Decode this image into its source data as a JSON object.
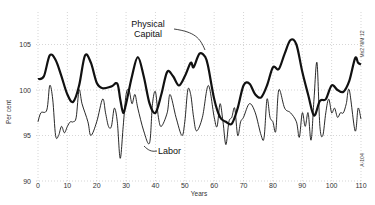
{
  "chart_data": {
    "type": "line",
    "title": "",
    "xlabel": "Years",
    "ylabel": "Per cent",
    "xlim": [
      0,
      110
    ],
    "ylim": [
      90,
      106
    ],
    "xticks": [
      0,
      10,
      20,
      30,
      40,
      50,
      60,
      70,
      80,
      90,
      100,
      110
    ],
    "xtick_labels": [
      "0",
      "10",
      "20",
      "30",
      "40",
      "50",
      "60",
      "70",
      "80",
      "90",
      "100",
      "110"
    ],
    "yticks": [
      90,
      95,
      100,
      105
    ],
    "ytick_labels": [
      "90",
      "95",
      "100",
      "105"
    ],
    "grid": true,
    "legend": "inline annotations",
    "annotations": [
      {
        "text": "Physical Capital",
        "points_to": [
          57,
          104
        ]
      },
      {
        "text": "Labor",
        "points_to": [
          36,
          94.2
        ]
      }
    ],
    "margin_notes": [
      "Ms2 N/M 12",
      "A-104"
    ],
    "series": [
      {
        "name": "Physical Capital",
        "style": "thick",
        "x": [
          0,
          2,
          4,
          6,
          8,
          10,
          12,
          14,
          16,
          18,
          20,
          22,
          25,
          27,
          28,
          29,
          30,
          32,
          34,
          36,
          38,
          40,
          42,
          44,
          46,
          48,
          50,
          52,
          53,
          55,
          57,
          58,
          60,
          62,
          64,
          66,
          68,
          70,
          72,
          74,
          76,
          78,
          80,
          82,
          84,
          86,
          88,
          90,
          92,
          94,
          96,
          98,
          100,
          102,
          104,
          106,
          108,
          109,
          110
        ],
        "y": [
          101.2,
          101.5,
          103.8,
          103.3,
          101.5,
          99.5,
          98.7,
          100.5,
          103.8,
          103.0,
          100.8,
          100.2,
          100.4,
          100.7,
          99.0,
          97.5,
          98.5,
          101.5,
          103.6,
          101.5,
          98.5,
          97.5,
          99.5,
          102.0,
          101.5,
          100.5,
          101.5,
          103.0,
          102.5,
          104.0,
          103.6,
          102.5,
          99.0,
          97.0,
          96.5,
          96.3,
          98.0,
          100.5,
          100.7,
          99.5,
          99.2,
          100.5,
          102.5,
          102.3,
          104.0,
          105.5,
          105.0,
          102.0,
          99.5,
          97.2,
          98.8,
          99.0,
          100.5,
          100.0,
          99.8,
          101.0,
          103.5,
          103.0,
          102.8
        ]
      },
      {
        "name": "Labor",
        "style": "thin",
        "x": [
          0,
          1,
          3,
          4,
          5,
          6,
          7,
          8,
          9,
          10,
          11,
          12,
          13,
          14,
          15,
          17,
          18,
          20,
          22,
          23,
          24,
          25,
          26,
          27,
          28,
          29,
          30,
          31,
          32,
          33,
          34,
          36,
          38,
          39,
          40,
          41,
          42,
          44,
          45,
          47,
          49,
          50,
          51,
          52,
          53,
          54,
          56,
          58,
          60,
          61,
          62,
          63,
          64,
          65,
          66,
          67,
          68,
          69,
          70,
          72,
          74,
          76,
          77,
          78,
          79,
          80,
          81,
          82,
          84,
          86,
          88,
          89,
          90,
          91,
          92,
          93,
          94,
          95,
          96,
          97,
          98,
          99,
          100,
          101,
          102,
          103,
          104,
          105,
          106,
          108,
          109,
          110
        ],
        "y": [
          96.5,
          97.5,
          97.8,
          100.5,
          99.0,
          95.0,
          95.0,
          96.0,
          95.3,
          96.0,
          96.5,
          96.5,
          97.0,
          100.0,
          98.5,
          96.5,
          95.0,
          96.5,
          99.0,
          97.5,
          96.0,
          96.0,
          98.0,
          96.5,
          92.5,
          96.0,
          99.5,
          100.0,
          98.5,
          99.5,
          98.0,
          95.5,
          94.2,
          98.5,
          99.8,
          97.0,
          96.0,
          97.5,
          99.5,
          97.0,
          95.0,
          96.5,
          100.0,
          99.5,
          97.0,
          95.5,
          97.0,
          100.5,
          97.0,
          96.0,
          98.5,
          96.5,
          94.0,
          96.5,
          97.0,
          98.0,
          95.0,
          96.5,
          97.0,
          98.5,
          97.5,
          95.0,
          94.8,
          99.0,
          97.0,
          96.5,
          95.5,
          100.0,
          98.0,
          97.5,
          96.5,
          94.8,
          97.5,
          96.0,
          97.5,
          94.5,
          99.0,
          103.0,
          96.0,
          95.0,
          97.5,
          99.0,
          97.5,
          98.0,
          97.0,
          97.5,
          97.5,
          98.5,
          100.0,
          95.5,
          98.0,
          96.8
        ]
      }
    ]
  }
}
